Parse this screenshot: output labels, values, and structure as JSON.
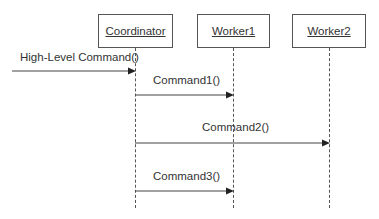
{
  "diagram": {
    "type": "sequence",
    "participants": [
      {
        "name": "Coordinator",
        "x": 135
      },
      {
        "name": "Worker1",
        "x": 233
      },
      {
        "name": "Worker2",
        "x": 329
      }
    ],
    "messages": [
      {
        "label": "High-Level Command()",
        "from": "external",
        "to": "Coordinator"
      },
      {
        "label": "Command1()",
        "from": "Coordinator",
        "to": "Worker1"
      },
      {
        "label": "Command2()",
        "from": "Coordinator",
        "to": "Worker2"
      },
      {
        "label": "Command3()",
        "from": "Coordinator",
        "to": "Worker1"
      }
    ],
    "colors": {
      "line": "#555555",
      "text": "#333333",
      "background": "#ffffff"
    }
  }
}
